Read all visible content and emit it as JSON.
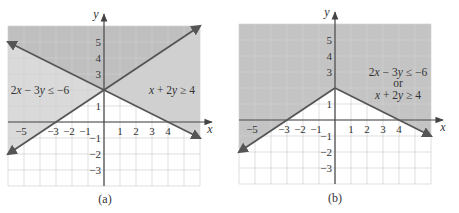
{
  "figure": {
    "panels": [
      {
        "id": "a",
        "caption": "(a)",
        "axis_labels": {
          "x": "x",
          "y": "y"
        },
        "annotations": {
          "left": "2x − 3y ≤ −6",
          "right": "x + 2y ≥ 4"
        }
      },
      {
        "id": "b",
        "caption": "(b)",
        "axis_labels": {
          "x": "x",
          "y": "y"
        },
        "annotations": {
          "line1": "2x − 3y ≤ −6",
          "line2": "or",
          "line3": "x + 2y ≥ 4"
        }
      }
    ]
  },
  "colors": {
    "line": "#555555",
    "axis": "#444444",
    "grid": "#d2d2d2",
    "background": "#ffffff"
  },
  "chart_data": [
    {
      "type": "line",
      "title": "(a)",
      "xlabel": "x",
      "ylabel": "y",
      "xlim": [
        -6,
        6
      ],
      "ylim": [
        -4,
        6
      ],
      "grid": true,
      "x_tick_labels": [
        -5,
        -3,
        -2,
        -1,
        1,
        2,
        3,
        4
      ],
      "y_tick_labels": [
        5,
        4,
        3,
        1,
        -1,
        -2,
        -3
      ],
      "series": [
        {
          "name": "2x − 3y = −6",
          "points": [
            [
              -6,
              -2
            ],
            [
              0,
              2
            ],
            [
              6,
              6
            ]
          ],
          "arrows": "both"
        },
        {
          "name": "x + 2y = 4",
          "points": [
            [
              -6,
              5
            ],
            [
              0,
              2
            ],
            [
              6,
              -1
            ]
          ],
          "arrows": "both"
        }
      ],
      "shaded_regions": [
        {
          "name": "2x − 3y ≤ −6",
          "points": [
            [
              -6,
              -2
            ],
            [
              6,
              6
            ],
            [
              -6,
              6
            ]
          ],
          "shade": "#dadada"
        },
        {
          "name": "x + 2y ≥ 4",
          "points": [
            [
              -6,
              5
            ],
            [
              6,
              -1
            ],
            [
              6,
              6
            ],
            [
              -6,
              6
            ]
          ],
          "shade": "#d0d0d0"
        },
        {
          "name": "overlap",
          "points": [
            [
              -6,
              5
            ],
            [
              0,
              2
            ],
            [
              6,
              6
            ],
            [
              -6,
              6
            ]
          ],
          "shade": "#bfbfbf"
        }
      ],
      "annotations": [
        "2x − 3y ≤ −6",
        "x + 2y ≥ 4"
      ]
    },
    {
      "type": "line",
      "title": "(b)",
      "xlabel": "x",
      "ylabel": "y",
      "xlim": [
        -6,
        6
      ],
      "ylim": [
        -4,
        6
      ],
      "grid": true,
      "x_tick_labels": [
        -5,
        -3,
        -2,
        -1,
        1,
        2,
        3,
        4
      ],
      "y_tick_labels": [
        5,
        4,
        3,
        1,
        -1,
        -2,
        -3
      ],
      "series": [
        {
          "name": "2x − 3y = −6 (boundary)",
          "points": [
            [
              -6,
              -2
            ],
            [
              0,
              2
            ]
          ],
          "arrows": "start"
        },
        {
          "name": "x + 2y = 4 (boundary)",
          "points": [
            [
              0,
              2
            ],
            [
              6,
              -1
            ]
          ],
          "arrows": "end"
        }
      ],
      "shaded_regions": [
        {
          "name": "2x − 3y ≤ −6 or x + 2y ≥ 4",
          "points": [
            [
              -6,
              -2
            ],
            [
              0,
              2
            ],
            [
              6,
              -1
            ],
            [
              6,
              6
            ],
            [
              -6,
              6
            ]
          ],
          "shade": "#c4c4c4"
        }
      ],
      "annotations": [
        "2x − 3y ≤ −6",
        "or",
        "x + 2y ≥ 4"
      ]
    }
  ]
}
